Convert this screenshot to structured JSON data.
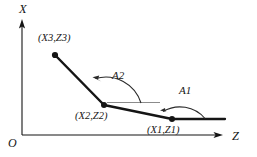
{
  "figure": {
    "title_alt": "Slope angle diagram of a three-point polyline in the Z-X plane",
    "axes": {
      "vertical_label": "X",
      "horizontal_label": "Z",
      "origin_label": "O"
    },
    "points": [
      {
        "id": "p3",
        "label": "(X3,Z3)",
        "x": 55,
        "y": 55,
        "label_x": 38,
        "label_y": 33
      },
      {
        "id": "p2",
        "label": "(X2,Z2)",
        "x": 104,
        "y": 105,
        "label_x": 75,
        "label_y": 111
      },
      {
        "id": "p1",
        "label": "(X1,Z1)",
        "x": 172,
        "y": 119,
        "label_x": 147,
        "label_y": 125
      }
    ],
    "angles": [
      {
        "id": "a2",
        "label": "A2",
        "label_x": 112,
        "label_y": 70
      },
      {
        "id": "a1",
        "label": "A1",
        "label_x": 179,
        "label_y": 85
      }
    ],
    "colors": {
      "stroke": "#151515",
      "reference_line": "#8b8b8b",
      "arc": "#2a2a2a",
      "background": "#ffffff"
    }
  }
}
